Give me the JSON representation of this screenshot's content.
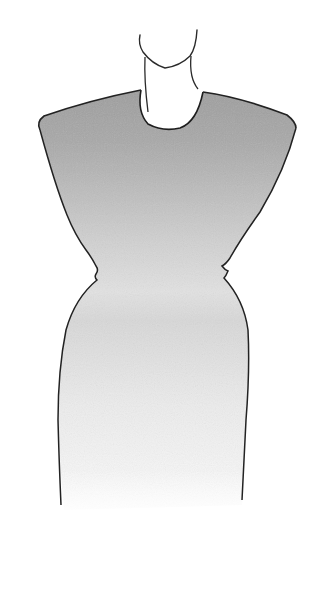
{
  "illustration": {
    "subject": "fashion sketch of a sleeveless shift dress with cap shoulders",
    "background": "#ffffff",
    "ink_color": "#2a2a2a",
    "shade_top": "#a9a9a9",
    "shade_mid": "#d2d2d2",
    "shade_bottom": "#f6f6f6"
  }
}
